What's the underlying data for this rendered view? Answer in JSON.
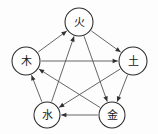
{
  "diagram": {
    "type": "directed-graph",
    "shape": "pentagon-with-pentagram",
    "background_color": "#fdfdfd",
    "node_fill": "#ffffff",
    "node_stroke": "#2b2b2b",
    "edge_color": "#4a4a4a",
    "arrowhead_color": "#303030",
    "label_color": "#181818",
    "nodes": [
      {
        "id": "fire",
        "label": "火",
        "cx": 79,
        "cy": 22,
        "r": 14
      },
      {
        "id": "earth",
        "label": "土",
        "cx": 133,
        "cy": 61,
        "r": 14
      },
      {
        "id": "metal",
        "label": "金",
        "cx": 112,
        "cy": 115,
        "r": 13
      },
      {
        "id": "water",
        "label": "水",
        "cx": 47,
        "cy": 115,
        "r": 13
      },
      {
        "id": "wood",
        "label": "木",
        "cx": 26,
        "cy": 61,
        "r": 14
      }
    ],
    "edges": [
      {
        "id": "wood-to-fire",
        "from": "wood",
        "to": "fire",
        "cycle": "generating"
      },
      {
        "id": "fire-to-earth",
        "from": "fire",
        "to": "earth",
        "cycle": "generating"
      },
      {
        "id": "earth-to-metal",
        "from": "earth",
        "to": "metal",
        "cycle": "generating"
      },
      {
        "id": "metal-to-water",
        "from": "metal",
        "to": "water",
        "cycle": "generating"
      },
      {
        "id": "water-to-wood",
        "from": "water",
        "to": "wood",
        "cycle": "generating"
      },
      {
        "id": "wood-to-earth",
        "from": "wood",
        "to": "earth",
        "cycle": "overcoming"
      },
      {
        "id": "earth-to-water",
        "from": "earth",
        "to": "water",
        "cycle": "overcoming"
      },
      {
        "id": "water-to-fire",
        "from": "water",
        "to": "fire",
        "cycle": "overcoming"
      },
      {
        "id": "fire-to-metal",
        "from": "fire",
        "to": "metal",
        "cycle": "overcoming"
      },
      {
        "id": "metal-to-wood",
        "from": "metal",
        "to": "wood",
        "cycle": "overcoming"
      }
    ]
  }
}
